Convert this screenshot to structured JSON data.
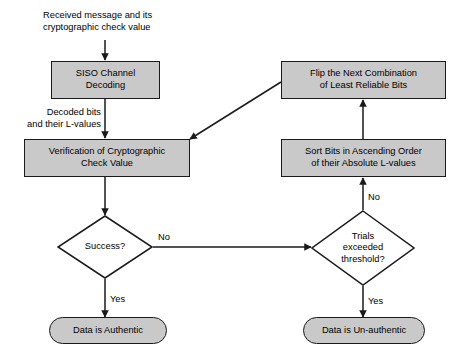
{
  "diagram": {
    "fill_color": "#c9c9c9",
    "stroke_color": "#1a1a1a",
    "background_color": "#ffffff",
    "nodes": {
      "siso": {
        "label": "SISO Channel\nDecoding",
        "shape": "process"
      },
      "verification": {
        "label": "Verification of Cryptographic\nCheck Value",
        "shape": "process"
      },
      "flip": {
        "label": "Flip the Next Combination\nof Least Reliable Bits",
        "shape": "process"
      },
      "sort": {
        "label": "Sort Bits in Ascending Order\nof their Absolute L-values",
        "shape": "process"
      },
      "success": {
        "label": "Success?",
        "shape": "decision"
      },
      "trials": {
        "label": "Trials\nexceeded\nthreshold?",
        "shape": "decision"
      },
      "authentic": {
        "label": "Data is Authentic",
        "shape": "terminal"
      },
      "unauthentic": {
        "label": "Data is Un-authentic",
        "shape": "terminal"
      }
    },
    "annotations": {
      "input": "Received message and its\ncryptographic check value",
      "decoded": "Decoded bits\nand their L-values"
    },
    "edge_labels": {
      "success_no": "No",
      "success_yes": "Yes",
      "trials_no": "No",
      "trials_yes": "Yes"
    }
  }
}
